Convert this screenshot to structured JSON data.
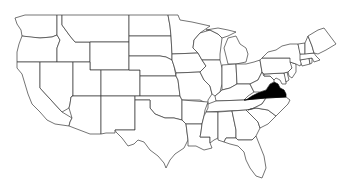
{
  "map": {
    "type": "choropleth-outline",
    "region": "Contiguous United States",
    "highlighted_states": [
      "Virginia"
    ],
    "colors": {
      "highlight_fill": "#000000",
      "default_fill": "#ffffff",
      "border": "#3a3a3a",
      "background": "#ffffff"
    },
    "states": [
      {
        "name": "Washington",
        "highlighted": false
      },
      {
        "name": "Oregon",
        "highlighted": false
      },
      {
        "name": "California",
        "highlighted": false
      },
      {
        "name": "Idaho",
        "highlighted": false
      },
      {
        "name": "Nevada",
        "highlighted": false
      },
      {
        "name": "Montana",
        "highlighted": false
      },
      {
        "name": "Wyoming",
        "highlighted": false
      },
      {
        "name": "Utah",
        "highlighted": false
      },
      {
        "name": "Arizona",
        "highlighted": false
      },
      {
        "name": "Colorado",
        "highlighted": false
      },
      {
        "name": "New Mexico",
        "highlighted": false
      },
      {
        "name": "North Dakota",
        "highlighted": false
      },
      {
        "name": "South Dakota",
        "highlighted": false
      },
      {
        "name": "Nebraska",
        "highlighted": false
      },
      {
        "name": "Kansas",
        "highlighted": false
      },
      {
        "name": "Oklahoma",
        "highlighted": false
      },
      {
        "name": "Texas",
        "highlighted": false
      },
      {
        "name": "Minnesota",
        "highlighted": false
      },
      {
        "name": "Iowa",
        "highlighted": false
      },
      {
        "name": "Missouri",
        "highlighted": false
      },
      {
        "name": "Arkansas",
        "highlighted": false
      },
      {
        "name": "Louisiana",
        "highlighted": false
      },
      {
        "name": "Wisconsin",
        "highlighted": false
      },
      {
        "name": "Illinois",
        "highlighted": false
      },
      {
        "name": "Michigan",
        "highlighted": false
      },
      {
        "name": "Indiana",
        "highlighted": false
      },
      {
        "name": "Ohio",
        "highlighted": false
      },
      {
        "name": "Kentucky",
        "highlighted": false
      },
      {
        "name": "Tennessee",
        "highlighted": false
      },
      {
        "name": "Mississippi",
        "highlighted": false
      },
      {
        "name": "Alabama",
        "highlighted": false
      },
      {
        "name": "Georgia",
        "highlighted": false
      },
      {
        "name": "Florida",
        "highlighted": false
      },
      {
        "name": "South Carolina",
        "highlighted": false
      },
      {
        "name": "North Carolina",
        "highlighted": false
      },
      {
        "name": "Virginia",
        "highlighted": true
      },
      {
        "name": "West Virginia",
        "highlighted": false
      },
      {
        "name": "Maryland",
        "highlighted": false
      },
      {
        "name": "Delaware",
        "highlighted": false
      },
      {
        "name": "Pennsylvania",
        "highlighted": false
      },
      {
        "name": "New Jersey",
        "highlighted": false
      },
      {
        "name": "New York",
        "highlighted": false
      },
      {
        "name": "Connecticut",
        "highlighted": false
      },
      {
        "name": "Rhode Island",
        "highlighted": false
      },
      {
        "name": "Massachusetts",
        "highlighted": false
      },
      {
        "name": "Vermont",
        "highlighted": false
      },
      {
        "name": "New Hampshire",
        "highlighted": false
      },
      {
        "name": "Maine",
        "highlighted": false
      }
    ]
  }
}
